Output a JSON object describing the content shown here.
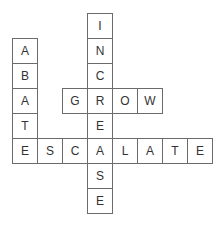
{
  "puzzle": {
    "type": "crossword",
    "origin": {
      "x": 12,
      "y": 13
    },
    "cell_size": 25,
    "words": [
      {
        "word": "INCREASE",
        "direction": "down",
        "row": 0,
        "col": 3
      },
      {
        "word": "ABATE",
        "direction": "down",
        "row": 1,
        "col": 0
      },
      {
        "word": "GROW",
        "direction": "across",
        "row": 3,
        "col": 2
      },
      {
        "word": "ESCALATE",
        "direction": "across",
        "row": 5,
        "col": 0
      }
    ],
    "cells": [
      {
        "row": 0,
        "col": 3,
        "letter": "I"
      },
      {
        "row": 1,
        "col": 0,
        "letter": "A"
      },
      {
        "row": 1,
        "col": 3,
        "letter": "N"
      },
      {
        "row": 2,
        "col": 0,
        "letter": "B"
      },
      {
        "row": 2,
        "col": 3,
        "letter": "C"
      },
      {
        "row": 3,
        "col": 0,
        "letter": "A"
      },
      {
        "row": 3,
        "col": 2,
        "letter": "G"
      },
      {
        "row": 3,
        "col": 3,
        "letter": "R"
      },
      {
        "row": 3,
        "col": 4,
        "letter": "O"
      },
      {
        "row": 3,
        "col": 5,
        "letter": "W"
      },
      {
        "row": 4,
        "col": 0,
        "letter": "T"
      },
      {
        "row": 4,
        "col": 3,
        "letter": "E"
      },
      {
        "row": 5,
        "col": 0,
        "letter": "E"
      },
      {
        "row": 5,
        "col": 1,
        "letter": "S"
      },
      {
        "row": 5,
        "col": 2,
        "letter": "C"
      },
      {
        "row": 5,
        "col": 3,
        "letter": "A"
      },
      {
        "row": 5,
        "col": 4,
        "letter": "L"
      },
      {
        "row": 5,
        "col": 5,
        "letter": "A"
      },
      {
        "row": 5,
        "col": 6,
        "letter": "T"
      },
      {
        "row": 5,
        "col": 7,
        "letter": "E"
      },
      {
        "row": 6,
        "col": 3,
        "letter": "S"
      },
      {
        "row": 7,
        "col": 3,
        "letter": "E"
      }
    ]
  }
}
